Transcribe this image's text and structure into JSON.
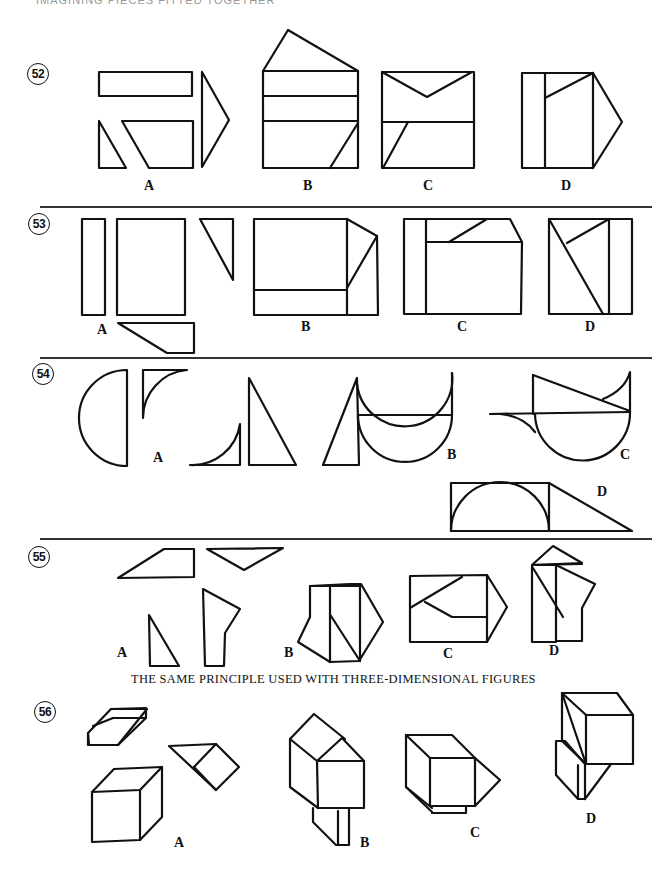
{
  "page": {
    "header_partial": "IMAGINING PIECES FITTED TOGETHER",
    "caption": "THE SAME PRINCIPLE USED WITH THREE-DIMENSIONAL FIGURES"
  },
  "problems": [
    {
      "number": "52",
      "options": [
        "A",
        "B",
        "C",
        "D"
      ]
    },
    {
      "number": "53",
      "options": [
        "A",
        "B",
        "C",
        "D"
      ]
    },
    {
      "number": "54",
      "options": [
        "A",
        "B",
        "C",
        "D"
      ]
    },
    {
      "number": "55",
      "options": [
        "A",
        "B",
        "C",
        "D"
      ]
    },
    {
      "number": "56",
      "options": [
        "A",
        "B",
        "C",
        "D"
      ]
    }
  ],
  "colors": {
    "ink": "#111111",
    "paper": "#ffffff"
  }
}
